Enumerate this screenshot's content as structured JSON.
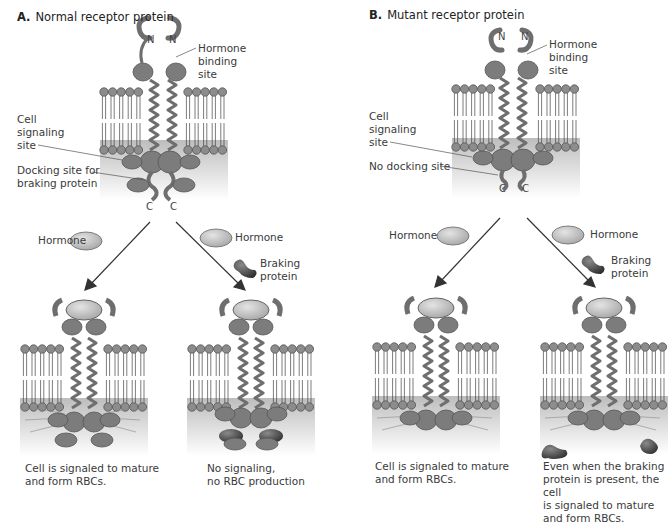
{
  "panel_a": {
    "letter": "A.",
    "title": "Normal receptor protein",
    "terminus_n": "N",
    "terminus_c": "C",
    "labels": {
      "hormone_binding_site": "Hormone\nbinding\nsite",
      "cell_signaling_site": "Cell\nsignaling\nsite",
      "docking_site": "Docking site for\nbraking protein"
    },
    "left_branch": {
      "hormone_label": "Hormone",
      "caption": "Cell is signaled to mature\nand form RBCs."
    },
    "right_branch": {
      "hormone_label": "Hormone",
      "braking_label": "Braking\nprotein",
      "caption": "No signaling,\nno RBC production"
    }
  },
  "panel_b": {
    "letter": "B.",
    "title": "Mutant receptor protein",
    "terminus_n": "N",
    "terminus_c": "C",
    "labels": {
      "hormone_binding_site": "Hormone\nbinding\nsite",
      "cell_signaling_site": "Cell\nsignaling\nsite",
      "no_docking_site": "No docking site"
    },
    "left_branch": {
      "hormone_label": "Hormone",
      "caption": "Cell is signaled to mature\nand form RBCs."
    },
    "right_branch": {
      "hormone_label": "Hormone",
      "braking_label": "Braking\nprotein",
      "caption": "Even when the braking\nprotein is present, the cell\nis signaled to mature\nand form RBCs."
    }
  },
  "colors": {
    "protein": "#7a7a7a",
    "protein_dark": "#4a4a4a",
    "hormone": "#b5b5b5",
    "braking_protein": "#3c3c3c",
    "membrane_head": "#8c8c8c",
    "cytoplasm_gradient_top": "#c4c4c4"
  }
}
